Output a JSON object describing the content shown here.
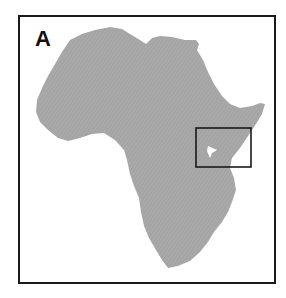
{
  "figure": {
    "panel_label": "A",
    "colors": {
      "land": "#a8a8a8",
      "frame": "#1a1a1a",
      "inset_box": "#1a1a1a",
      "lake": "#ffffff",
      "background": "#ffffff"
    },
    "inset_box": {
      "region": "East Africa (Lake Victoria area)"
    }
  }
}
